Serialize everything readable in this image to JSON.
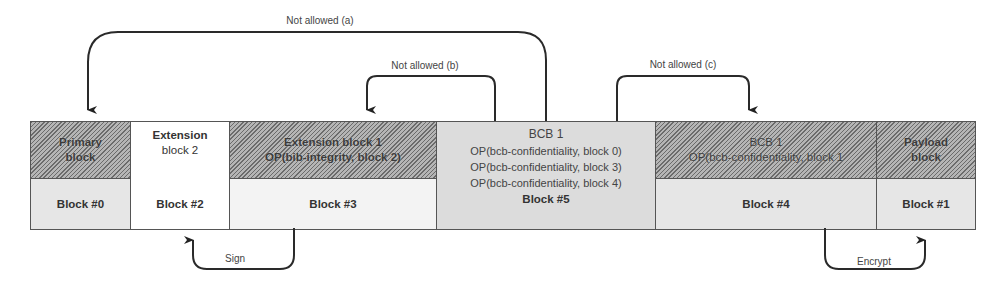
{
  "arrows": {
    "a": {
      "label": "Not allowed (a)",
      "from": "Block #5",
      "to": "Block #0"
    },
    "b": {
      "label": "Not allowed (b)",
      "from": "Block #5",
      "to": "Block #3"
    },
    "c": {
      "label": "Not allowed (c)",
      "from": "Block #5",
      "to": "Block #4"
    },
    "sign": {
      "label": "Sign",
      "from": "Block #3",
      "to": "Block #2"
    },
    "encrypt": {
      "label": "Encrypt",
      "from": "Block #4",
      "to": "Block #1"
    }
  },
  "blocks": [
    {
      "header_line1": "Primary",
      "header_line2": "block",
      "number": "Block #0",
      "style": "hatched"
    },
    {
      "header_line1": "Extension",
      "header_line2": "block 2",
      "number": "Block #2",
      "style": "plain"
    },
    {
      "header_line1": "Extension block 1",
      "header_line2": "OP(bib-integrity, block 2)",
      "number": "Block #3",
      "style": "hatched"
    },
    {
      "header_line1": "BCB 1",
      "ops": [
        "OP(bcb-confidentiality, block 0)",
        "OP(bcb-confidentiality, block 3)",
        "OP(bcb-confidentiality, block 4)"
      ],
      "number": "Block #5",
      "style": "gray"
    },
    {
      "header_line1": "BCB 1",
      "header_line2": "OP(bcb-confidentiality, block 1",
      "number": "Block #4",
      "style": "hatched"
    },
    {
      "header_line1": "Payload",
      "header_line2": "block",
      "number": "Block #1",
      "style": "hatched"
    }
  ]
}
